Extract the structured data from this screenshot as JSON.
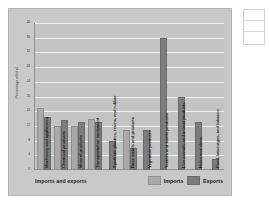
{
  "chart_data": {
    "type": "bar",
    "title": "",
    "xlabel": "Imports and exports",
    "ylabel": "Percentage of total",
    "ylim": [
      0,
      40
    ],
    "grid": true,
    "legend_position": "bottom-right",
    "yticks": [
      "0",
      "4",
      "8",
      "12",
      "16",
      "20",
      "24",
      "28",
      "32",
      "36",
      "40"
    ],
    "categories": [
      "Machinery and appliances",
      "Chemical products",
      "Mineral products",
      "Transportation equipment",
      "Synthetic plastics, resins, and rubber",
      "Base metals and products",
      "Vegetable products",
      "Textiles and textile products",
      "Live animals and animal products",
      "Hides and skins",
      "Food, beverages, and tobacco"
    ],
    "series": [
      {
        "name": "Imports",
        "color": "#a9a9a9",
        "values": [
          17,
          12,
          12,
          14,
          0,
          11,
          0,
          0,
          0,
          0,
          0
        ]
      },
      {
        "name": "Exports",
        "color": "#7c7c7c",
        "values": [
          14.5,
          13.5,
          13,
          13,
          8,
          6,
          11,
          36,
          20,
          13,
          3
        ]
      }
    ]
  },
  "legend": {
    "imports_label": "Imports",
    "exports_label": "Exports"
  },
  "axes": {
    "x_title": "Imports and exports",
    "y_title": "Percentage of total"
  },
  "side_panel": {
    "rows": [
      "",
      "",
      ""
    ]
  }
}
